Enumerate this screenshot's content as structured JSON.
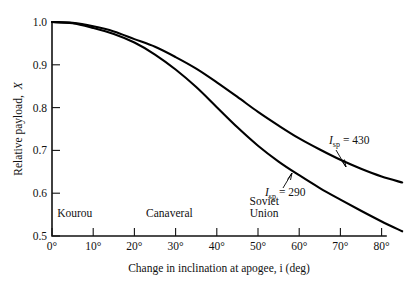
{
  "chart_data": {
    "type": "line",
    "title": "",
    "xlabel": "Change in inclination at apogee, i (deg)",
    "ylabel": "Relative payload, X",
    "xlim": [
      0,
      85
    ],
    "ylim": [
      0.5,
      1.0
    ],
    "grid": false,
    "legend_position": "inline-annotations",
    "x_ticks": [
      0,
      10,
      20,
      30,
      40,
      50,
      60,
      70,
      80
    ],
    "x_tick_labels": [
      "0°",
      "10°",
      "20°",
      "30°",
      "40°",
      "50°",
      "60°",
      "70°",
      "80°"
    ],
    "y_ticks": [
      0.5,
      0.6,
      0.7,
      0.8,
      0.9,
      1.0
    ],
    "y_tick_labels": [
      "0.5",
      "0.6",
      "0.7",
      "0.8",
      "0.9",
      "1.0"
    ],
    "x": [
      0,
      5,
      10,
      15,
      20,
      25,
      30,
      35,
      40,
      45,
      50,
      55,
      60,
      65,
      70,
      75,
      80,
      85
    ],
    "series": [
      {
        "name": "Isp = 430",
        "label_base": "I",
        "label_sub": "sp",
        "label_value": "= 430",
        "values": [
          1.0,
          0.998,
          0.99,
          0.978,
          0.96,
          0.942,
          0.918,
          0.891,
          0.859,
          0.825,
          0.79,
          0.758,
          0.728,
          0.702,
          0.678,
          0.657,
          0.639,
          0.625
        ]
      },
      {
        "name": "Isp = 290",
        "label_base": "I",
        "label_sub": "sp",
        "label_value": "= 290",
        "values": [
          1.0,
          0.997,
          0.986,
          0.972,
          0.952,
          0.924,
          0.889,
          0.848,
          0.801,
          0.754,
          0.711,
          0.674,
          0.642,
          0.612,
          0.585,
          0.559,
          0.534,
          0.511
        ]
      }
    ],
    "annotations": [
      {
        "text": "Kourou",
        "x_deg": 5.5,
        "y_value": 0.545
      },
      {
        "text": "Canaveral",
        "x_deg": 28.5,
        "y_value": 0.545
      },
      {
        "text": "Soviet",
        "x_deg": 51.5,
        "y_value": 0.572
      },
      {
        "text": "Union",
        "x_deg": 51.5,
        "y_value": 0.545
      }
    ],
    "colors": {
      "curve": "#000000",
      "axis": "#121212",
      "background": "#ffffff"
    }
  }
}
